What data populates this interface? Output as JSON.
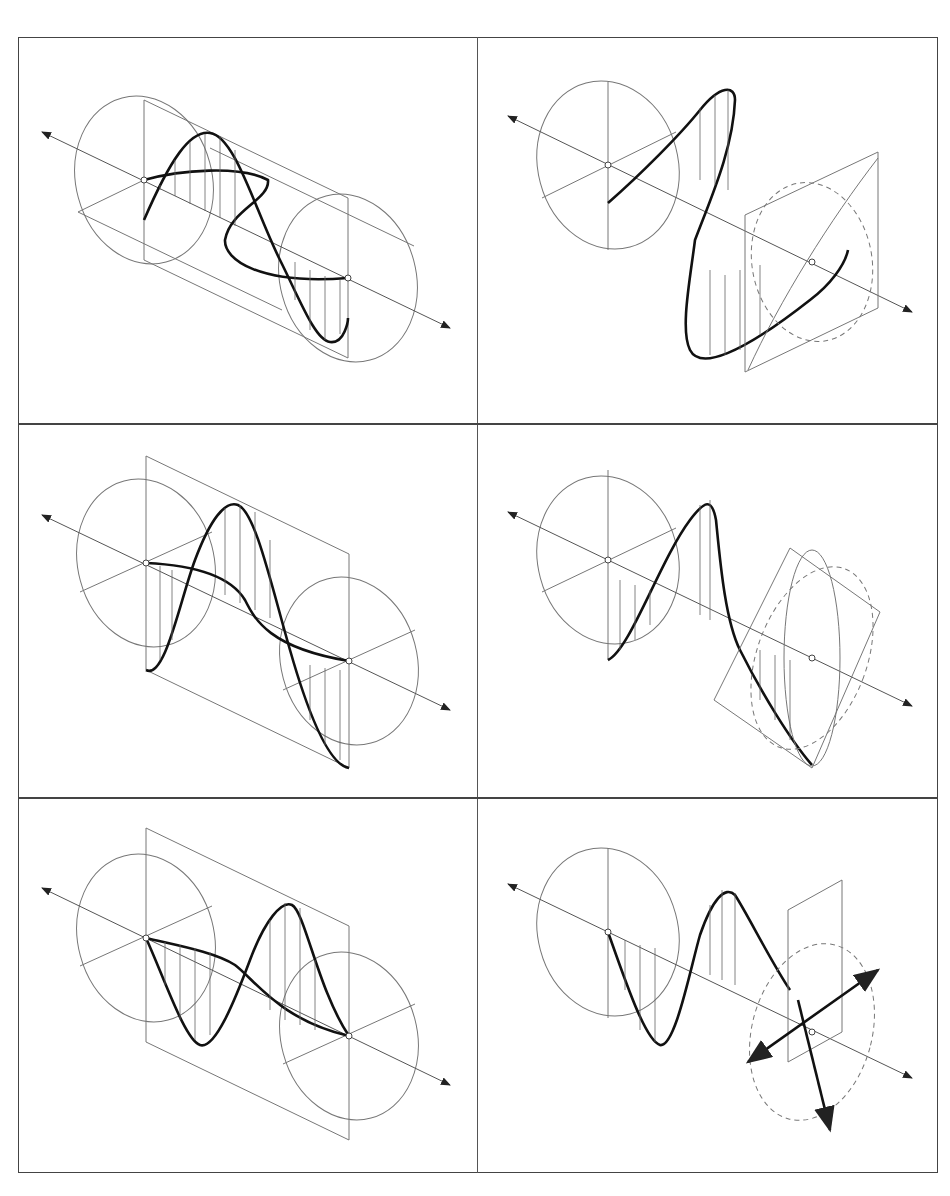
{
  "figure": {
    "layout": {
      "rows": 3,
      "columns": 2
    },
    "colors": {
      "background": "#ffffff",
      "line": "#777777",
      "wave": "#111111",
      "frame": "#444444"
    },
    "panels": [
      {
        "id": "p1",
        "row": 1,
        "col": 1,
        "label": "",
        "kind": "two-perpendicular-waves-cylinder"
      },
      {
        "id": "p2",
        "row": 1,
        "col": 2,
        "label": "",
        "kind": "elliptical-polarization-projection"
      },
      {
        "id": "p3",
        "row": 2,
        "col": 1,
        "label": "",
        "kind": "two-waves-phase-shift-plane"
      },
      {
        "id": "p4",
        "row": 2,
        "col": 2,
        "label": "",
        "kind": "elliptical-polarization-tilted-plane"
      },
      {
        "id": "p5",
        "row": 3,
        "col": 1,
        "label": "",
        "kind": "two-waves-in-phase-plane"
      },
      {
        "id": "p6",
        "row": 3,
        "col": 2,
        "label": "",
        "kind": "linear-polarization-projection"
      }
    ]
  }
}
